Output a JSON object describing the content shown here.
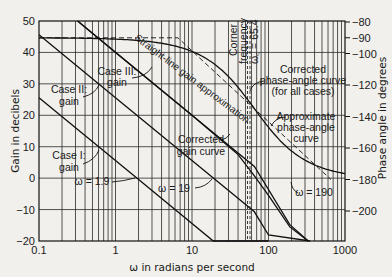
{
  "chart_data": {
    "type": "line",
    "title": "",
    "xlabel": "ω in radians per second",
    "ylabel": "Gain in decibels",
    "y2label": "Phase angle in degrees",
    "xscale": "log",
    "xlim": [
      0.1,
      1000
    ],
    "ylim": [
      -20,
      50
    ],
    "y2lim": [
      -210,
      -80
    ],
    "grid": true,
    "x_ticks": [
      "0.1",
      "1",
      "10",
      "100",
      "1000"
    ],
    "y_ticks": [
      "50",
      "40",
      "30",
      "20",
      "10",
      "0",
      "−10",
      "−20"
    ],
    "y2_ticks": [
      "−80",
      "−90",
      "−100",
      "−120",
      "−140",
      "−160",
      "−180",
      "−200"
    ],
    "corner_frequency": 65.4,
    "series": [
      {
        "name": "Case I: gain",
        "axis": "left",
        "x": [
          0.1,
          1.9,
          19,
          65.4,
          100
        ],
        "y": [
          25.6,
          0,
          -20,
          -30.7,
          -38.1
        ]
      },
      {
        "name": "Case II: gain",
        "axis": "left",
        "x": [
          0.1,
          1,
          19,
          65.4,
          100,
          350
        ],
        "y": [
          45.6,
          25.6,
          0,
          -10.7,
          -18.1,
          -40
        ]
      },
      {
        "name": "Case III: gain (straight-line gain approximation)",
        "axis": "left",
        "x": [
          0.32,
          1,
          10,
          65.4,
          190,
          330
        ],
        "y": [
          50,
          40,
          20,
          3.7,
          -14.8,
          -24
        ]
      },
      {
        "name": "Corrected gain curve",
        "axis": "left",
        "x": [
          0.32,
          10,
          40,
          65.4,
          100,
          190,
          330
        ],
        "y": [
          50,
          20,
          7.5,
          0.7,
          -5.5,
          -15.5,
          -24
        ]
      },
      {
        "name": "Approximate phase-angle curve",
        "axis": "right",
        "x": [
          0.1,
          6.54,
          654
        ],
        "y": [
          -90,
          -90,
          -180
        ]
      },
      {
        "name": "Corrected phase-angle curve (for all cases)",
        "axis": "right",
        "x": [
          0.1,
          3,
          10,
          30,
          65.4,
          150,
          400,
          1000
        ],
        "y": [
          -90,
          -92.6,
          -98.7,
          -114.6,
          -135,
          -156.4,
          -170.7,
          -176.3
        ]
      }
    ],
    "annotations": [
      {
        "text": "Case I: gain"
      },
      {
        "text": "Case II: gain"
      },
      {
        "text": "Case III: gain"
      },
      {
        "text": "Straight-line gain approximation"
      },
      {
        "text": "Corner frequency ω_c = 65.4"
      },
      {
        "text": "Corrected phase-angle curve (for all cases)"
      },
      {
        "text": "Approximate phase-angle curve"
      },
      {
        "text": "Corrected gain curve"
      },
      {
        "text": "ω = 1.9"
      },
      {
        "text": "ω = 19"
      },
      {
        "text": "ω = 190"
      }
    ]
  },
  "labels": {
    "xlabel": "ω in radians per second",
    "ylabel": "Gain in decibels",
    "y2label": "Phase angle in degrees",
    "x_ticks": [
      "0.1",
      "1",
      "10",
      "100",
      "1000"
    ],
    "y_ticks": [
      "50",
      "40",
      "30",
      "20",
      "10",
      "0",
      "−10",
      "−20"
    ],
    "y2_ticks": [
      "−80",
      "−90",
      "−100",
      "−120",
      "−140",
      "−160",
      "−180",
      "−200"
    ],
    "case1_l1": "Case I:",
    "case1_l2": "gain",
    "case2_l1": "Case II:",
    "case2_l2": "gain",
    "case3_l1": "Case III:",
    "case3_l2": "gain",
    "straight_line": "Straight-line gain approximation",
    "corner_l1": "Corner",
    "corner_l2": "frequency",
    "corner_l3": "ω꜀ = 65.4",
    "corr_phase_l1": "Corrected",
    "corr_phase_l2": "phase-angle curve",
    "corr_phase_l3": "(for all cases)",
    "approx_phase_l1": "Approximate",
    "approx_phase_l2": "phase-angle",
    "approx_phase_l3": "curve",
    "corr_gain_l1": "Corrected",
    "corr_gain_l2": "gain curve",
    "w19_label": "ω = 1.9",
    "w190_label": "ω = 19",
    "w1900_label": "ω = 190"
  },
  "colors": {
    "background": "#f1f0ec",
    "ink": "#1a1a1a",
    "grid": "#2a2a2a"
  }
}
